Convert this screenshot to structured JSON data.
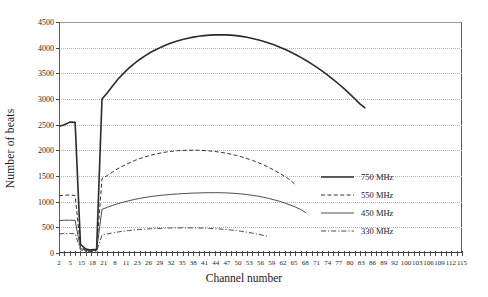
{
  "chart_data": {
    "type": "line",
    "title": "",
    "xlabel": "Channel number",
    "ylabel": "Number of beats",
    "ylim": [
      0,
      4500
    ],
    "ytick_step": 500,
    "yticks": [
      0,
      500,
      1000,
      1500,
      2000,
      2500,
      3000,
      3500,
      4000,
      4500
    ],
    "grid": "horizontal-dotted",
    "legend_position": "center-right-inside",
    "xticks": [
      2,
      5,
      15,
      18,
      21,
      8,
      11,
      23,
      26,
      29,
      32,
      35,
      38,
      41,
      44,
      47,
      50,
      53,
      56,
      59,
      62,
      65,
      68,
      71,
      74,
      77,
      80,
      83,
      86,
      89,
      92,
      100,
      103,
      106,
      109,
      112,
      115
    ],
    "x_index_count": 76,
    "series": [
      {
        "name": "750 MHz",
        "style": "solid-thick",
        "color": "#2b2b2b",
        "peak_value": 4250,
        "start_spike_value": 2550,
        "trough_value": 60,
        "resume_value": 3000,
        "end_value": 2820,
        "points": [
          [
            0,
            2470
          ],
          [
            1,
            2500
          ],
          [
            2,
            2550
          ],
          [
            3,
            2545
          ],
          [
            4,
            170
          ],
          [
            5,
            75
          ],
          [
            6,
            60
          ],
          [
            7,
            70
          ],
          [
            8,
            3000
          ],
          [
            9,
            3120
          ],
          [
            10,
            3260
          ],
          [
            11,
            3390
          ],
          [
            12,
            3500
          ],
          [
            13,
            3600
          ],
          [
            14,
            3690
          ],
          [
            15,
            3770
          ],
          [
            16,
            3840
          ],
          [
            17,
            3905
          ],
          [
            18,
            3960
          ],
          [
            19,
            4010
          ],
          [
            20,
            4055
          ],
          [
            21,
            4095
          ],
          [
            22,
            4130
          ],
          [
            23,
            4160
          ],
          [
            24,
            4185
          ],
          [
            25,
            4205
          ],
          [
            26,
            4222
          ],
          [
            27,
            4235
          ],
          [
            28,
            4245
          ],
          [
            29,
            4250
          ],
          [
            30,
            4252
          ],
          [
            31,
            4250
          ],
          [
            32,
            4244
          ],
          [
            33,
            4234
          ],
          [
            34,
            4220
          ],
          [
            35,
            4202
          ],
          [
            36,
            4180
          ],
          [
            37,
            4155
          ],
          [
            38,
            4125
          ],
          [
            39,
            4092
          ],
          [
            40,
            4055
          ],
          [
            41,
            4014
          ],
          [
            42,
            3970
          ],
          [
            43,
            3920
          ],
          [
            44,
            3868
          ],
          [
            45,
            3810
          ],
          [
            46,
            3750
          ],
          [
            47,
            3685
          ],
          [
            48,
            3615
          ],
          [
            49,
            3542
          ],
          [
            50,
            3465
          ],
          [
            51,
            3383
          ],
          [
            52,
            3297
          ],
          [
            53,
            3207
          ],
          [
            54,
            3110
          ],
          [
            55,
            3010
          ],
          [
            56,
            2905
          ],
          [
            57,
            2820
          ]
        ]
      },
      {
        "name": "550 MHz",
        "style": "dashed",
        "color": "#333333",
        "peak_value": 2000,
        "start_spike_value": 1130,
        "trough_value": 50,
        "resume_value": 1450,
        "end_value": 1330,
        "points": [
          [
            0,
            1115
          ],
          [
            1,
            1125
          ],
          [
            2,
            1130
          ],
          [
            3,
            1120
          ],
          [
            4,
            120
          ],
          [
            5,
            55
          ],
          [
            6,
            50
          ],
          [
            7,
            60
          ],
          [
            8,
            1450
          ],
          [
            9,
            1510
          ],
          [
            10,
            1580
          ],
          [
            11,
            1645
          ],
          [
            12,
            1700
          ],
          [
            13,
            1752
          ],
          [
            14,
            1798
          ],
          [
            15,
            1838
          ],
          [
            16,
            1872
          ],
          [
            17,
            1902
          ],
          [
            18,
            1928
          ],
          [
            19,
            1950
          ],
          [
            20,
            1968
          ],
          [
            21,
            1982
          ],
          [
            22,
            1992
          ],
          [
            23,
            1998
          ],
          [
            24,
            2002
          ],
          [
            25,
            2003
          ],
          [
            26,
            2001
          ],
          [
            27,
            1996
          ],
          [
            28,
            1988
          ],
          [
            29,
            1977
          ],
          [
            30,
            1963
          ],
          [
            31,
            1946
          ],
          [
            32,
            1925
          ],
          [
            33,
            1900
          ],
          [
            34,
            1872
          ],
          [
            35,
            1840
          ],
          [
            36,
            1804
          ],
          [
            37,
            1764
          ],
          [
            38,
            1720
          ],
          [
            39,
            1670
          ],
          [
            40,
            1615
          ],
          [
            41,
            1556
          ],
          [
            42,
            1492
          ],
          [
            43,
            1423
          ],
          [
            44,
            1330
          ]
        ]
      },
      {
        "name": "450 MHz",
        "style": "solid-thin",
        "color": "#3a3a3a",
        "peak_value": 1175,
        "start_spike_value": 640,
        "trough_value": 45,
        "resume_value": 850,
        "end_value": 780,
        "points": [
          [
            0,
            632
          ],
          [
            1,
            638
          ],
          [
            2,
            640
          ],
          [
            3,
            636
          ],
          [
            4,
            90
          ],
          [
            5,
            48
          ],
          [
            6,
            45
          ],
          [
            7,
            52
          ],
          [
            8,
            850
          ],
          [
            9,
            890
          ],
          [
            10,
            928
          ],
          [
            11,
            962
          ],
          [
            12,
            992
          ],
          [
            13,
            1018
          ],
          [
            14,
            1042
          ],
          [
            15,
            1063
          ],
          [
            16,
            1082
          ],
          [
            17,
            1098
          ],
          [
            18,
            1112
          ],
          [
            19,
            1124
          ],
          [
            20,
            1134
          ],
          [
            21,
            1143
          ],
          [
            22,
            1150
          ],
          [
            23,
            1157
          ],
          [
            24,
            1162
          ],
          [
            25,
            1167
          ],
          [
            26,
            1170
          ],
          [
            27,
            1173
          ],
          [
            28,
            1175
          ],
          [
            29,
            1175
          ],
          [
            30,
            1174
          ],
          [
            31,
            1171
          ],
          [
            32,
            1166
          ],
          [
            33,
            1159
          ],
          [
            34,
            1150
          ],
          [
            35,
            1138
          ],
          [
            36,
            1124
          ],
          [
            37,
            1107
          ],
          [
            38,
            1087
          ],
          [
            39,
            1064
          ],
          [
            40,
            1038
          ],
          [
            41,
            1008
          ],
          [
            42,
            974
          ],
          [
            43,
            936
          ],
          [
            44,
            894
          ],
          [
            45,
            848
          ],
          [
            46,
            780
          ]
        ]
      },
      {
        "name": "330 MHz",
        "style": "dash-dot",
        "color": "#3a3a3a",
        "peak_value": 490,
        "start_spike_value": 380,
        "trough_value": 30,
        "resume_value": 350,
        "end_value": 320,
        "points": [
          [
            0,
            372
          ],
          [
            1,
            378
          ],
          [
            2,
            380
          ],
          [
            3,
            376
          ],
          [
            4,
            60
          ],
          [
            5,
            32
          ],
          [
            6,
            30
          ],
          [
            7,
            36
          ],
          [
            8,
            350
          ],
          [
            9,
            372
          ],
          [
            10,
            392
          ],
          [
            11,
            410
          ],
          [
            12,
            425
          ],
          [
            13,
            438
          ],
          [
            14,
            449
          ],
          [
            15,
            458
          ],
          [
            16,
            466
          ],
          [
            17,
            472
          ],
          [
            18,
            477
          ],
          [
            19,
            481
          ],
          [
            20,
            484
          ],
          [
            21,
            487
          ],
          [
            22,
            489
          ],
          [
            23,
            490
          ],
          [
            24,
            490
          ],
          [
            25,
            489
          ],
          [
            26,
            487
          ],
          [
            27,
            484
          ],
          [
            28,
            480
          ],
          [
            29,
            474
          ],
          [
            30,
            467
          ],
          [
            31,
            458
          ],
          [
            32,
            448
          ],
          [
            33,
            436
          ],
          [
            34,
            422
          ],
          [
            35,
            406
          ],
          [
            36,
            388
          ],
          [
            37,
            368
          ],
          [
            38,
            345
          ],
          [
            39,
            320
          ]
        ]
      }
    ]
  },
  "axes": {
    "ylabel": "Number of beats",
    "xlabel": "Channel number"
  },
  "legend": {
    "entries": [
      {
        "label": "750 MHz"
      },
      {
        "label": "550 MHz"
      },
      {
        "label": "450 MHz"
      },
      {
        "label": "330 MHz"
      }
    ]
  }
}
